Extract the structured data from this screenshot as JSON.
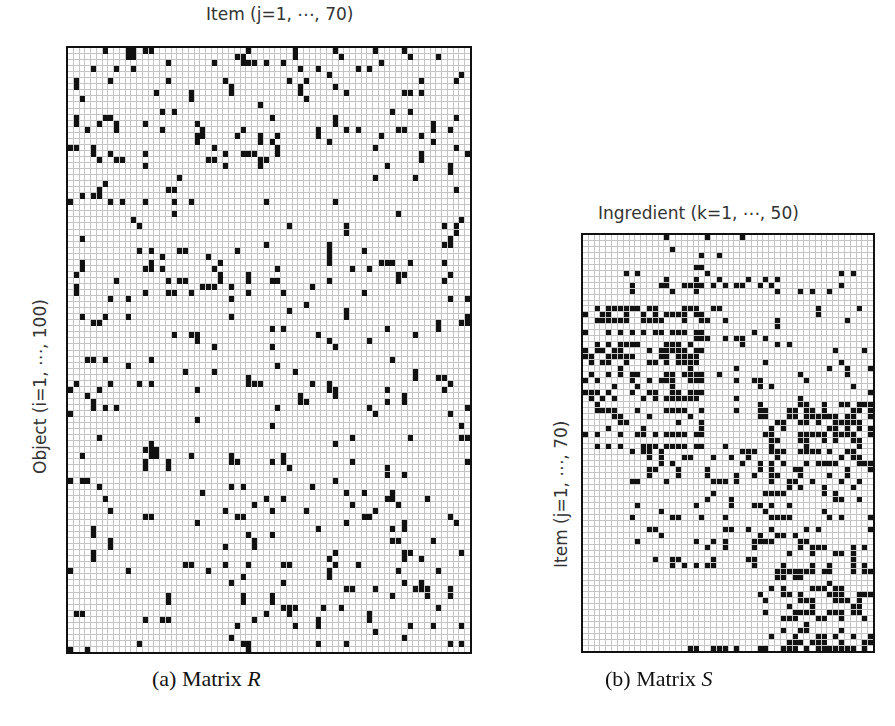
{
  "figure": {
    "panel_a": {
      "top_label": "Item (j=1, ⋯, 70)",
      "left_label": "Object (i=1, ⋯, 100)",
      "caption_prefix": "(a) Matrix ",
      "caption_symbol": "R"
    },
    "panel_b": {
      "top_label": "Ingredient (k=1, ⋯, 50)",
      "left_label": "Item (j=1, ⋯, 70)",
      "caption_prefix": "(b) Matrix ",
      "caption_symbol": "S"
    },
    "colors": {
      "background": "#ffffff",
      "grid_line": "#c4c4c4",
      "cell_on": "#111111",
      "frame": "#111111"
    }
  },
  "chart_data": [
    {
      "type": "heatmap",
      "title": "(a) Matrix R",
      "xlabel": "Item (j=1, ⋯, 70)",
      "ylabel": "Object (i=1, ⋯, 100)",
      "rows": 100,
      "cols": 70,
      "values": "binary (1 = filled black cell, 0 = empty); sparse random pattern, ~5% density",
      "seed_rows": {
        "0": [
          6,
          10,
          11,
          13,
          14,
          31,
          39,
          46,
          53,
          58
        ],
        "1": [
          10,
          11,
          29,
          30,
          39,
          47,
          59,
          64
        ],
        "2": [
          17,
          25,
          30,
          31,
          32,
          34,
          37,
          54
        ],
        "3": [
          4,
          8,
          11,
          40,
          43,
          50,
          52
        ]
      },
      "density": 0.05,
      "grid": true
    },
    {
      "type": "heatmap",
      "title": "(b) Matrix S",
      "xlabel": "Ingredient (k=1, ⋯, 50)",
      "ylabel": "Item (j=1, ⋯, 70)",
      "rows": 70,
      "cols": 50,
      "values": "binary; banded structure: top rows have clusters in cols 15-33, middle rows have long horizontal runs in cols 0-20, lower rows have dense clusters in cols 32-49",
      "bands": [
        {
          "rows": [
            0,
            10
          ],
          "cols": [
            14,
            34
          ],
          "density": 0.18
        },
        {
          "rows": [
            6,
            12
          ],
          "cols": [
            0,
            48
          ],
          "density": 0.08
        },
        {
          "rows": [
            12,
            36
          ],
          "cols": [
            0,
            21
          ],
          "density": 0.55
        },
        {
          "rows": [
            12,
            36
          ],
          "cols": [
            21,
            50
          ],
          "density": 0.12
        },
        {
          "rows": [
            28,
            40
          ],
          "cols": [
            30,
            50
          ],
          "density": 0.45
        },
        {
          "rows": [
            36,
            56
          ],
          "cols": [
            8,
            35
          ],
          "density": 0.25
        },
        {
          "rows": [
            40,
            70
          ],
          "cols": [
            30,
            50
          ],
          "density": 0.4
        },
        {
          "rows": [
            69,
            70
          ],
          "cols": [
            15,
            32
          ],
          "density": 0.7
        }
      ],
      "grid": true
    }
  ]
}
